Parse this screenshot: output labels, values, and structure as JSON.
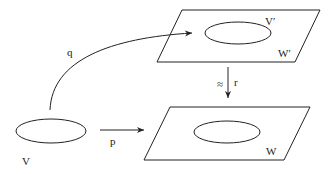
{
  "diagram": {
    "labels": {
      "V": "V",
      "V_prime": "V′",
      "W": "W",
      "W_prime": "W′",
      "p": "p",
      "q": "q",
      "r": "r",
      "approx": "≈"
    },
    "colors": {
      "stroke": "#222222",
      "background": "#ffffff"
    }
  }
}
